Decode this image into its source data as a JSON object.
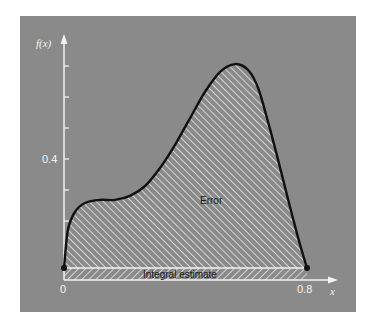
{
  "chart_data": {
    "type": "area",
    "title": "",
    "xlabel": "x",
    "ylabel": "f(x)",
    "x_ticks": [
      {
        "value": 0,
        "label": "0"
      },
      {
        "value": 0.8,
        "label": "0.8"
      }
    ],
    "y_ticks": [
      {
        "value": 0.1,
        "label": ""
      },
      {
        "value": 0.2,
        "label": ""
      },
      {
        "value": 0.3,
        "label": ""
      },
      {
        "value": 0.4,
        "label": "0.4"
      },
      {
        "value": 0.5,
        "label": ""
      },
      {
        "value": 0.6,
        "label": ""
      },
      {
        "value": 0.7,
        "label": ""
      }
    ],
    "xlim": [
      0,
      0.8
    ],
    "ylim": [
      0,
      0.8
    ],
    "grid": false,
    "series": [
      {
        "name": "f(x)",
        "x": [
          0,
          0.013,
          0.036,
          0.069,
          0.119,
          0.168,
          0.217,
          0.267,
          0.316,
          0.365,
          0.415,
          0.464,
          0.514,
          0.563,
          0.606,
          0.639,
          0.672,
          0.705,
          0.738,
          0.771,
          0.8
        ],
        "y": [
          0.048,
          0.171,
          0.229,
          0.258,
          0.268,
          0.268,
          0.281,
          0.313,
          0.371,
          0.445,
          0.532,
          0.616,
          0.681,
          0.706,
          0.687,
          0.629,
          0.519,
          0.397,
          0.268,
          0.145,
          0.048
        ]
      }
    ],
    "regions": [
      {
        "name": "Error",
        "label": "Error",
        "description": "hatched area between curve and straight line joining f(0) and f(0.8)"
      },
      {
        "name": "Integral estimate",
        "label": "Integral estimate",
        "description": "hatched trapezoid under the straight line from f(0) to f(0.8)"
      }
    ],
    "endpoints": [
      {
        "x": 0,
        "y": 0.048
      },
      {
        "x": 0.8,
        "y": 0.048
      }
    ],
    "annotations": [
      "Error",
      "Integral estimate"
    ],
    "legend": null
  },
  "colors": {
    "panel": "#8a8a8a",
    "curve": "#111111",
    "axis": "#f2f2f2",
    "hatch": "#e6e6e6"
  },
  "labels": {
    "y_axis_title": "f(x)",
    "x_axis_title": "x",
    "x_tick_0": "0",
    "x_tick_end": "0.8",
    "y_tick_04": "0.4",
    "error_label": "Error",
    "integral_label": "Integral estimate"
  }
}
